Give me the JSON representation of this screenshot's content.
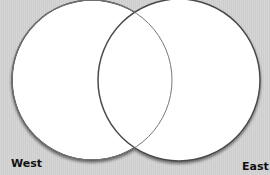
{
  "diagram": {
    "type": "venn",
    "sets": [
      {
        "label": "West",
        "cx": 92,
        "cy": 80,
        "r": 80
      },
      {
        "label": "East",
        "cx": 179,
        "cy": 80,
        "r": 81
      }
    ],
    "colors": {
      "background": "#d4d4d4",
      "fill": "#ffffff",
      "stroke": "#555555"
    }
  },
  "labels": {
    "west": "West",
    "east": "East"
  }
}
